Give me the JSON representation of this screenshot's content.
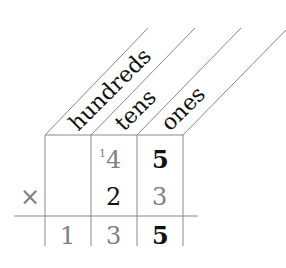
{
  "headers": {
    "hundreds": "hundreds",
    "tens": "tens",
    "ones": "ones"
  },
  "operator": "×",
  "rows": {
    "top": {
      "hundreds": "",
      "tens_carry": "1",
      "tens": "4",
      "ones": "5"
    },
    "multiplier": {
      "hundreds": "",
      "tens": "2",
      "ones": "3"
    },
    "result": {
      "hundreds": "1",
      "tens": "3",
      "ones": "5"
    }
  },
  "colors": {
    "line": "#777777",
    "gray_digit": "#808080",
    "black_digit": "#111111"
  }
}
